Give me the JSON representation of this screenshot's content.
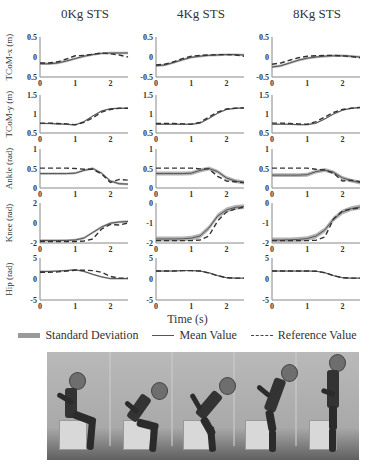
{
  "figure": {
    "column_titles": [
      "0Kg STS",
      "4Kg STS",
      "8Kg STS"
    ],
    "row_labels": [
      "TCoM-x (m)",
      "TCoM-y (m)",
      "Ankle (rad)",
      "Knee (rad)",
      "Hip (rad)"
    ],
    "xlabel": "Time (s)",
    "legend": {
      "std": "Standard Deviation",
      "mean": "Mean Value",
      "ref": "Reference Value"
    },
    "photo_caption": "Sit-to-stand sequence (5 frames)"
  },
  "colors": {
    "std_band": "#9a9a9a",
    "mean_line": "#555555",
    "ref_line": "#333333",
    "axis": "#888888",
    "tick_text": "#333333"
  },
  "chart_data": {
    "type": "line",
    "title": "",
    "layout": "5 rows x 3 columns of subplots",
    "xlabel": "Time (s)",
    "xlim": [
      0,
      2.5
    ],
    "xticks": [
      0,
      1,
      2
    ],
    "grid": false,
    "legend_position": "bottom",
    "legend": [
      "Standard Deviation",
      "Mean Value",
      "Reference Value"
    ],
    "x": [
      0,
      0.25,
      0.5,
      0.75,
      1.0,
      1.25,
      1.5,
      1.75,
      2.0,
      2.25,
      2.5
    ],
    "rows": [
      {
        "ylabel": "TCoM-x (m)",
        "ylim": [
          -0.5,
          0.5
        ],
        "yticks": [
          "0.5",
          "0",
          "-0.5"
        ],
        "yticks_per_col": [
          [
            "0.5",
            "0",
            "0.5"
          ],
          [
            "0.5",
            "0",
            "-0.5"
          ],
          [
            "0.5",
            "0",
            "-0.5"
          ]
        ],
        "panels": [
          {
            "mean": [
              -0.17,
              -0.17,
              -0.15,
              -0.1,
              -0.04,
              0.02,
              0.06,
              0.09,
              0.1,
              0.1,
              0.1
            ],
            "std": 0.03,
            "ref": [
              -0.15,
              -0.15,
              -0.12,
              -0.05,
              0.03,
              0.04,
              0.07,
              0.1,
              0.08,
              0.05,
              0.0
            ]
          },
          {
            "mean": [
              -0.22,
              -0.2,
              -0.14,
              -0.07,
              -0.01,
              0.02,
              0.04,
              0.05,
              0.06,
              0.06,
              0.05
            ],
            "std": 0.03,
            "ref": [
              -0.2,
              -0.18,
              -0.12,
              -0.04,
              0.02,
              0.04,
              0.05,
              0.06,
              0.06,
              0.05,
              0.02
            ]
          },
          {
            "mean": [
              -0.25,
              -0.22,
              -0.15,
              -0.08,
              -0.03,
              0.0,
              0.02,
              0.03,
              0.03,
              0.02,
              0.0
            ],
            "std": 0.03,
            "ref": [
              -0.18,
              -0.15,
              -0.08,
              -0.02,
              0.02,
              0.03,
              0.04,
              0.04,
              0.03,
              0.01,
              -0.02
            ]
          }
        ]
      },
      {
        "ylabel": "TCoM-y (m)",
        "ylim": [
          0.5,
          1.5
        ],
        "yticks": [
          "1.5",
          "1",
          "0.5"
        ],
        "panels": [
          {
            "mean": [
              0.75,
              0.75,
              0.74,
              0.73,
              0.71,
              0.8,
              0.95,
              1.08,
              1.14,
              1.15,
              1.15
            ],
            "std": 0.02,
            "ref": [
              0.76,
              0.76,
              0.75,
              0.74,
              0.72,
              0.78,
              0.9,
              1.05,
              1.12,
              1.15,
              1.15
            ]
          },
          {
            "mean": [
              0.73,
              0.73,
              0.73,
              0.73,
              0.73,
              0.76,
              0.88,
              1.02,
              1.12,
              1.15,
              1.16
            ],
            "std": 0.02,
            "ref": [
              0.75,
              0.75,
              0.75,
              0.74,
              0.73,
              0.78,
              0.92,
              1.05,
              1.13,
              1.15,
              1.16
            ]
          },
          {
            "mean": [
              0.73,
              0.73,
              0.73,
              0.72,
              0.72,
              0.76,
              0.87,
              1.0,
              1.1,
              1.15,
              1.17
            ],
            "std": 0.02,
            "ref": [
              0.76,
              0.76,
              0.75,
              0.74,
              0.73,
              0.8,
              0.92,
              1.04,
              1.12,
              1.15,
              1.17
            ]
          }
        ]
      },
      {
        "ylabel": "Ankle (rad)",
        "ylim": [
          0,
          1
        ],
        "yticks": [
          "1",
          "0.5",
          "0"
        ],
        "panels": [
          {
            "mean": [
              0.37,
              0.37,
              0.37,
              0.37,
              0.38,
              0.45,
              0.5,
              0.38,
              0.18,
              0.11,
              0.1
            ],
            "std": 0.03,
            "ref": [
              0.51,
              0.51,
              0.51,
              0.51,
              0.5,
              0.48,
              0.48,
              0.36,
              0.14,
              0.22,
              0.2
            ]
          },
          {
            "mean": [
              0.37,
              0.37,
              0.37,
              0.37,
              0.38,
              0.45,
              0.5,
              0.42,
              0.26,
              0.18,
              0.14
            ],
            "std": 0.05,
            "ref": [
              0.51,
              0.51,
              0.51,
              0.51,
              0.51,
              0.49,
              0.49,
              0.3,
              0.18,
              0.16,
              0.14
            ]
          },
          {
            "mean": [
              0.33,
              0.33,
              0.33,
              0.33,
              0.34,
              0.42,
              0.46,
              0.4,
              0.26,
              0.19,
              0.14
            ],
            "std": 0.05,
            "ref": [
              0.51,
              0.51,
              0.51,
              0.51,
              0.51,
              0.48,
              0.46,
              0.38,
              0.18,
              0.2,
              0.16
            ]
          }
        ]
      },
      {
        "ylabel": "Knee (rad)",
        "ylim_per_col": [
          [
            -2,
            2
          ],
          [
            -2,
            0
          ],
          [
            -2,
            0
          ]
        ],
        "yticks_per_col": [
          [
            "2",
            "0",
            "-2"
          ],
          [
            "0",
            "-1",
            "-2"
          ],
          [
            "0",
            "-1",
            "-2"
          ]
        ],
        "panels": [
          {
            "mean": [
              -1.75,
              -1.75,
              -1.75,
              -1.74,
              -1.7,
              -1.5,
              -0.95,
              -0.4,
              -0.02,
              0.1,
              0.15
            ],
            "std": 0.12,
            "ref": [
              -1.85,
              -1.85,
              -1.85,
              -1.85,
              -1.85,
              -1.8,
              -1.6,
              -0.6,
              -0.15,
              -0.2,
              0.0
            ]
          },
          {
            "mean": [
              -1.8,
              -1.8,
              -1.8,
              -1.79,
              -1.76,
              -1.65,
              -1.25,
              -0.65,
              -0.35,
              -0.22,
              -0.18
            ],
            "std": 0.12,
            "ref": [
              -1.88,
              -1.88,
              -1.88,
              -1.88,
              -1.88,
              -1.85,
              -1.65,
              -0.9,
              -0.45,
              -0.3,
              -0.2
            ]
          },
          {
            "mean": [
              -1.85,
              -1.85,
              -1.84,
              -1.82,
              -1.78,
              -1.65,
              -1.35,
              -0.8,
              -0.45,
              -0.28,
              -0.2
            ],
            "std": 0.12,
            "ref": [
              -1.88,
              -1.88,
              -1.88,
              -1.88,
              -1.88,
              -1.86,
              -1.7,
              -0.8,
              -0.4,
              -0.3,
              -0.25
            ]
          }
        ]
      },
      {
        "ylabel": "Hip (rad)",
        "ylim": [
          -5,
          5
        ],
        "yticks": [
          "5",
          "0",
          "-5"
        ],
        "panels": [
          {
            "mean": [
              1.8,
              1.8,
              1.9,
              2.0,
              2.2,
              1.8,
              1.1,
              0.5,
              0.1,
              0.1,
              0.1
            ],
            "std": 0.2,
            "ref": [
              1.6,
              1.6,
              1.7,
              1.9,
              2.1,
              2.1,
              2.0,
              1.6,
              0.6,
              0.2,
              0.2
            ]
          },
          {
            "mean": [
              1.9,
              1.9,
              1.9,
              2.0,
              2.0,
              1.9,
              1.5,
              0.8,
              0.3,
              0.2,
              0.2
            ],
            "std": 0.15,
            "ref": [
              1.9,
              1.9,
              1.9,
              2.0,
              2.0,
              1.9,
              1.4,
              0.8,
              0.3,
              0.2,
              0.2
            ]
          },
          {
            "mean": [
              1.9,
              1.9,
              1.9,
              1.9,
              1.9,
              1.85,
              1.5,
              0.8,
              0.3,
              0.2,
              0.2
            ],
            "std": 0.15,
            "ref": [
              1.9,
              1.9,
              1.9,
              1.9,
              1.9,
              1.85,
              1.5,
              0.8,
              0.3,
              0.2,
              0.2
            ]
          }
        ]
      }
    ]
  }
}
